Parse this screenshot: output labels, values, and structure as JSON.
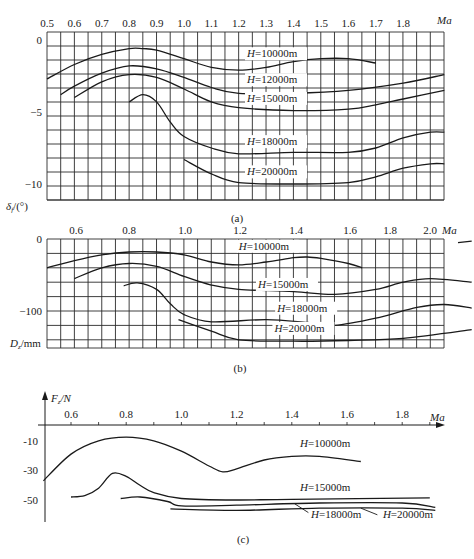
{
  "chart_data": [
    {
      "id": "a",
      "type": "line",
      "caption": "(a)",
      "title": "",
      "xlabel": "Ma",
      "ylabel": "δf/(°)",
      "xlim": [
        0.5,
        1.95
      ],
      "ylim": [
        -11.1,
        0.55
      ],
      "grid": true,
      "x_ticks": [
        0.5,
        0.6,
        0.7,
        0.8,
        0.9,
        1.0,
        1.1,
        1.2,
        1.3,
        1.4,
        1.5,
        1.6,
        1.7,
        1.8
      ],
      "x_tick_labels": [
        "0.5",
        "0.6",
        "0.7",
        "0.8",
        "0.9",
        "1.0",
        "1.1",
        "1.2",
        "1.3",
        "1.4",
        "1.5",
        "1.6",
        "1.7",
        "1.8"
      ],
      "y_ticks": [
        0,
        -5,
        -10
      ],
      "y_tick_labels": [
        "0",
        "−5",
        "−10"
      ],
      "series": [
        {
          "name": "H=10000m",
          "label_at": [
            1.23,
            -1.2
          ],
          "points": [
            [
              0.5,
              -2.7
            ],
            [
              0.6,
              -1.7
            ],
            [
              0.7,
              -1.0
            ],
            [
              0.8,
              -0.6
            ],
            [
              0.85,
              -0.6
            ],
            [
              0.9,
              -0.7
            ],
            [
              1.0,
              -1.3
            ],
            [
              1.1,
              -1.9
            ],
            [
              1.2,
              -2.1
            ],
            [
              1.3,
              -1.9
            ],
            [
              1.4,
              -1.5
            ],
            [
              1.5,
              -1.3
            ],
            [
              1.6,
              -1.3
            ],
            [
              1.7,
              -1.6
            ]
          ]
        },
        {
          "name": "H=12000m",
          "label_at": [
            1.23,
            -3.0
          ],
          "points": [
            [
              0.55,
              -3.8
            ],
            [
              0.6,
              -3.2
            ],
            [
              0.7,
              -2.3
            ],
            [
              0.8,
              -1.8
            ],
            [
              0.9,
              -2.0
            ],
            [
              1.0,
              -2.6
            ],
            [
              1.1,
              -3.3
            ],
            [
              1.2,
              -3.7
            ],
            [
              1.4,
              -3.7
            ],
            [
              1.6,
              -3.5
            ],
            [
              1.8,
              -3.0
            ],
            [
              1.95,
              -2.4
            ]
          ]
        },
        {
          "name": "H=15000m",
          "label_at": [
            1.23,
            -4.3
          ],
          "points": [
            [
              0.6,
              -4.0
            ],
            [
              0.7,
              -2.9
            ],
            [
              0.8,
              -2.4
            ],
            [
              0.9,
              -2.6
            ],
            [
              1.0,
              -3.4
            ],
            [
              1.1,
              -4.3
            ],
            [
              1.2,
              -4.7
            ],
            [
              1.4,
              -4.9
            ],
            [
              1.6,
              -4.8
            ],
            [
              1.7,
              -4.5
            ],
            [
              1.8,
              -4.1
            ],
            [
              1.95,
              -3.5
            ]
          ]
        },
        {
          "name": "H=18000m",
          "label_at": [
            1.23,
            -7.3
          ],
          "points": [
            [
              0.8,
              -4.3
            ],
            [
              0.85,
              -3.8
            ],
            [
              0.9,
              -4.3
            ],
            [
              0.95,
              -5.7
            ],
            [
              1.0,
              -6.7
            ],
            [
              1.1,
              -7.5
            ],
            [
              1.2,
              -7.9
            ],
            [
              1.4,
              -7.8
            ],
            [
              1.6,
              -7.8
            ],
            [
              1.7,
              -7.5
            ],
            [
              1.8,
              -6.8
            ],
            [
              1.9,
              -6.4
            ],
            [
              1.95,
              -6.4
            ]
          ]
        },
        {
          "name": "H=20000m",
          "label_at": [
            1.23,
            -9.4
          ],
          "points": [
            [
              1.0,
              -8.3
            ],
            [
              1.1,
              -9.3
            ],
            [
              1.2,
              -9.9
            ],
            [
              1.4,
              -10.0
            ],
            [
              1.6,
              -9.9
            ],
            [
              1.7,
              -9.5
            ],
            [
              1.8,
              -8.9
            ],
            [
              1.9,
              -8.6
            ],
            [
              1.95,
              -8.6
            ]
          ]
        }
      ]
    },
    {
      "id": "b",
      "type": "line",
      "caption": "(b)",
      "title": "",
      "xlabel": "Ma",
      "ylabel": "Dz/mm",
      "xlim": [
        0.5,
        2.05
      ],
      "ylim": [
        -150,
        0
      ],
      "grid": true,
      "x_ticks": [
        0.6,
        0.8,
        1.0,
        1.2,
        1.4,
        1.6,
        1.8,
        2.0
      ],
      "x_tick_labels": [
        "0.6",
        "0.8",
        "1.0",
        "1.2",
        "1.4",
        "1.6",
        "1.8",
        "2.0"
      ],
      "y_ticks": [
        0,
        -100
      ],
      "y_tick_labels": [
        "0",
        "−100"
      ],
      "series": [
        {
          "name": "H=10000m",
          "label_at": [
            1.2,
            -15
          ],
          "points": [
            [
              0.5,
              -40
            ],
            [
              0.6,
              -30
            ],
            [
              0.7,
              -22
            ],
            [
              0.8,
              -18
            ],
            [
              0.9,
              -18
            ],
            [
              1.0,
              -22
            ],
            [
              1.1,
              -32
            ],
            [
              1.2,
              -36
            ],
            [
              1.3,
              -32
            ],
            [
              1.4,
              -26
            ],
            [
              1.45,
              -25
            ],
            [
              1.5,
              -27
            ],
            [
              1.6,
              -34
            ],
            [
              1.65,
              -40
            ]
          ],
          "extra_segment": [
            [
              2.0,
              -5
            ],
            [
              2.05,
              -3
            ]
          ]
        },
        {
          "name": "H=15000m",
          "label_at": [
            1.27,
            -68
          ],
          "points": [
            [
              0.6,
              -55
            ],
            [
              0.7,
              -40
            ],
            [
              0.8,
              -34
            ],
            [
              0.9,
              -38
            ],
            [
              1.0,
              -52
            ],
            [
              1.1,
              -64
            ],
            [
              1.2,
              -70
            ],
            [
              1.4,
              -73
            ],
            [
              1.55,
              -77
            ],
            [
              1.7,
              -70
            ],
            [
              1.8,
              -60
            ],
            [
              1.9,
              -55
            ],
            [
              2.05,
              -60
            ]
          ]
        },
        {
          "name": "H=18000m",
          "label_at": [
            1.34,
            -101
          ],
          "points": [
            [
              0.78,
              -65
            ],
            [
              0.83,
              -61
            ],
            [
              0.9,
              -70
            ],
            [
              0.95,
              -90
            ],
            [
              1.0,
              -105
            ],
            [
              1.1,
              -115
            ],
            [
              1.3,
              -112
            ],
            [
              1.45,
              -116
            ],
            [
              1.55,
              -120
            ],
            [
              1.7,
              -110
            ],
            [
              1.85,
              -95
            ],
            [
              1.95,
              -91
            ],
            [
              2.05,
              -96
            ]
          ]
        },
        {
          "name": "H=20000m",
          "label_at": [
            1.33,
            -129
          ],
          "points": [
            [
              0.98,
              -112
            ],
            [
              1.1,
              -128
            ],
            [
              1.2,
              -140
            ],
            [
              1.4,
              -142
            ],
            [
              1.6,
              -141
            ],
            [
              1.8,
              -138
            ],
            [
              2.05,
              -126
            ]
          ]
        }
      ]
    },
    {
      "id": "c",
      "type": "line",
      "caption": "(c)",
      "title": "",
      "xlabel": "Ma",
      "ylabel": "Fz/N",
      "xlim": [
        0.5,
        1.95
      ],
      "ylim": [
        -62,
        18
      ],
      "grid": false,
      "x_ticks": [
        0.6,
        0.8,
        1.0,
        1.2,
        1.4,
        1.6,
        1.8
      ],
      "x_tick_labels": [
        "0.6",
        "0.8",
        "1.0",
        "1.2",
        "1.4",
        "1.6",
        "1.8"
      ],
      "y_ticks": [
        -10,
        -30,
        -50
      ],
      "y_tick_labels": [
        "-10",
        "-30",
        "-50"
      ],
      "series": [
        {
          "name": "H=10000m",
          "label_at": [
            1.43,
            -14
          ],
          "points": [
            [
              0.5,
              -37
            ],
            [
              0.6,
              -19
            ],
            [
              0.7,
              -10
            ],
            [
              0.8,
              -7.5
            ],
            [
              0.9,
              -10
            ],
            [
              1.0,
              -17
            ],
            [
              1.1,
              -27
            ],
            [
              1.15,
              -31
            ],
            [
              1.2,
              -29
            ],
            [
              1.3,
              -23
            ],
            [
              1.4,
              -20.5
            ],
            [
              1.5,
              -20.5
            ],
            [
              1.65,
              -24
            ]
          ]
        },
        {
          "name": "H=15000m",
          "label_at": [
            1.43,
            -44
          ],
          "points": [
            [
              0.6,
              -48
            ],
            [
              0.65,
              -47
            ],
            [
              0.7,
              -42
            ],
            [
              0.75,
              -32
            ],
            [
              0.8,
              -34
            ],
            [
              0.85,
              -40
            ],
            [
              0.9,
              -45
            ],
            [
              1.0,
              -49
            ],
            [
              1.2,
              -50
            ],
            [
              1.4,
              -49.5
            ],
            [
              1.9,
              -48.5
            ]
          ]
        },
        {
          "name": "H=18000m",
          "label_at": [
            1.47,
            -62
          ],
          "leader": [
            [
              1.41,
              -52.5
            ],
            [
              1.46,
              -58.5
            ]
          ],
          "points": [
            [
              0.78,
              -49
            ],
            [
              0.85,
              -48
            ],
            [
              0.95,
              -51
            ],
            [
              1.0,
              -54
            ],
            [
              1.2,
              -53.5
            ],
            [
              1.5,
              -52
            ],
            [
              1.8,
              -52
            ],
            [
              1.92,
              -55
            ]
          ]
        },
        {
          "name": "H=20000m",
          "label_at": [
            1.73,
            -62
          ],
          "leader": [
            [
              1.65,
              -55.5
            ],
            [
              1.71,
              -60
            ]
          ],
          "points": [
            [
              0.96,
              -56
            ],
            [
              1.2,
              -57
            ],
            [
              1.5,
              -55.5
            ],
            [
              1.8,
              -55.5
            ],
            [
              1.92,
              -57
            ]
          ]
        }
      ]
    }
  ],
  "captions": {
    "a": "(a)",
    "b": "(b)",
    "c": "(c)"
  },
  "axis_labels": {
    "a_x": "Ma",
    "a_y_sym": "δ",
    "a_y_sub": "f",
    "a_y_unit": "/(°)",
    "b_x": "Ma",
    "b_y_sym": "D",
    "b_y_sub": "z",
    "b_y_unit": "/mm",
    "c_x": "Ma",
    "c_y_sym": "F",
    "c_y_sub": "z",
    "c_y_unit": "/N"
  },
  "colors": {
    "line": "#1a1a1a",
    "grid": "#2a2a2a",
    "background": "#ffffff"
  }
}
